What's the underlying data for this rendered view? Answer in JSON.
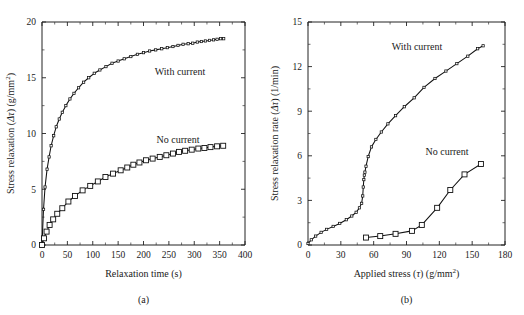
{
  "figure": {
    "background_color": "#ffffff",
    "ink_color": "#111111"
  },
  "panels": [
    {
      "id": "a",
      "caption": "(a)",
      "xlabel": "Relaxation time (s)",
      "ylabel_parts": {
        "main": "Stress relaxation (",
        "symbol": "Δτ",
        "units": ") (g/mm",
        "exponent": "2",
        "close": ")"
      },
      "ylabel_plain": "Stress relaxation (Δτ) (g/mm2)",
      "xticks": [
        "0",
        "50",
        "100",
        "150",
        "200",
        "250",
        "300",
        "350",
        "400"
      ],
      "yticks": [
        "0",
        "5",
        "10",
        "15",
        "20"
      ],
      "series_labels": {
        "with_current": "With current",
        "no_current": "No current"
      }
    },
    {
      "id": "b",
      "caption": "(b)",
      "xlabel_parts": {
        "main": "Applied stress (",
        "symbol": "τ",
        "units": ")  (g/mm",
        "exponent": "2",
        "close": ")"
      },
      "xlabel_plain": "Applied stress (τ)  (g/mm2)",
      "ylabel_parts": {
        "main": "Stress relaxation rate (",
        "symbol": "Δτ",
        "units": ") (1/min)"
      },
      "ylabel_plain": "Stress relaxation rate (Δτ) (1/min)",
      "xticks": [
        "0",
        "30",
        "60",
        "90",
        "120",
        "150",
        "180"
      ],
      "yticks": [
        "0",
        "3",
        "6",
        "9",
        "12",
        "15"
      ],
      "series_labels": {
        "with_current": "With current",
        "no_current": "No current"
      }
    }
  ],
  "chart_data": [
    {
      "type": "line",
      "id": "panel-a",
      "title": "",
      "xlabel": "Relaxation time (s)",
      "ylabel": "Stress relaxation (Δτ) (g/mm2)",
      "xlim": [
        0,
        400
      ],
      "ylim": [
        0,
        20
      ],
      "xticks": [
        0,
        50,
        100,
        150,
        200,
        250,
        300,
        350,
        400
      ],
      "yticks": [
        0,
        5,
        10,
        15,
        20
      ],
      "grid": false,
      "legend_position": "inline-annotation",
      "series": [
        {
          "name": "With current",
          "marker": "small-open-square",
          "x": [
            0,
            3,
            6,
            10,
            14,
            18,
            23,
            28,
            34,
            40,
            47,
            55,
            63,
            72,
            82,
            92,
            103,
            114,
            126,
            138,
            150,
            162,
            175,
            188,
            200,
            212,
            224,
            236,
            247,
            258,
            268,
            278,
            288,
            297,
            306,
            314,
            322,
            330,
            338,
            345,
            352,
            358
          ],
          "y": [
            0.0,
            3.2,
            5.2,
            6.8,
            7.9,
            8.9,
            9.8,
            10.6,
            11.3,
            11.9,
            12.5,
            13.1,
            13.6,
            14.1,
            14.6,
            15.0,
            15.4,
            15.7,
            16.0,
            16.3,
            16.5,
            16.7,
            16.9,
            17.1,
            17.25,
            17.4,
            17.5,
            17.6,
            17.7,
            17.8,
            17.9,
            18.0,
            18.05,
            18.1,
            18.2,
            18.25,
            18.3,
            18.35,
            18.4,
            18.45,
            18.5,
            18.5
          ]
        },
        {
          "name": "No current",
          "marker": "large-open-square",
          "x": [
            0,
            4,
            9,
            15,
            22,
            30,
            40,
            52,
            65,
            80,
            95,
            110,
            125,
            140,
            155,
            168,
            180,
            192,
            205,
            218,
            232,
            245,
            258,
            270,
            282,
            295,
            308,
            320,
            332,
            345,
            357
          ],
          "y": [
            0.0,
            0.6,
            1.2,
            1.8,
            2.3,
            2.8,
            3.3,
            3.9,
            4.4,
            4.9,
            5.3,
            5.7,
            6.1,
            6.4,
            6.7,
            6.95,
            7.2,
            7.4,
            7.6,
            7.75,
            7.9,
            8.05,
            8.2,
            8.35,
            8.45,
            8.55,
            8.65,
            8.7,
            8.78,
            8.85,
            8.9
          ]
        }
      ]
    },
    {
      "type": "line",
      "id": "panel-b",
      "title": "",
      "xlabel": "Applied stress (τ)  (g/mm2)",
      "ylabel": "Stress relaxation rate (Δτ) (1/min)",
      "xlim": [
        0,
        180
      ],
      "ylim": [
        0,
        15
      ],
      "xticks": [
        0,
        30,
        60,
        90,
        120,
        150,
        180
      ],
      "yticks": [
        0,
        3,
        6,
        9,
        12,
        15
      ],
      "grid": false,
      "legend_position": "inline-annotation",
      "series": [
        {
          "name": "With current",
          "marker": "small-open-square",
          "x": [
            0,
            3,
            7,
            12,
            17,
            23,
            29,
            35,
            40,
            44,
            47,
            49,
            50,
            50.5,
            51,
            51.5,
            52,
            53,
            55,
            58,
            62,
            67,
            73,
            80,
            88,
            97,
            106,
            116,
            126,
            136,
            146,
            155,
            160
          ],
          "y": [
            0.1,
            0.35,
            0.6,
            0.85,
            1.05,
            1.25,
            1.45,
            1.7,
            1.95,
            2.2,
            2.5,
            2.8,
            3.3,
            3.9,
            4.4,
            4.7,
            4.9,
            5.3,
            5.95,
            6.6,
            7.1,
            7.6,
            8.15,
            8.7,
            9.3,
            9.9,
            10.6,
            11.2,
            11.7,
            12.2,
            12.7,
            13.2,
            13.4
          ]
        },
        {
          "name": "No current",
          "marker": "large-open-square",
          "x": [
            53,
            66,
            80,
            95,
            104,
            118,
            130,
            143,
            158
          ],
          "y": [
            0.5,
            0.6,
            0.75,
            0.95,
            1.35,
            2.5,
            3.7,
            4.75,
            5.45
          ]
        }
      ]
    }
  ]
}
